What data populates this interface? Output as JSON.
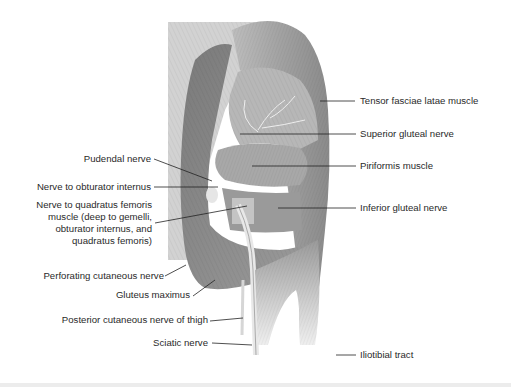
{
  "figure": {
    "labels_left": [
      {
        "id": "pudendal",
        "text": "Pudendal nerve"
      },
      {
        "id": "obturator",
        "text": "Nerve to obturator internus"
      },
      {
        "id": "quadratus_1",
        "text": "Nerve to quadratus femoris"
      },
      {
        "id": "quadratus_2",
        "text": "muscle (deep to gemelli,"
      },
      {
        "id": "quadratus_3",
        "text": "obturator internus, and"
      },
      {
        "id": "quadratus_4",
        "text": "quadratus femoris)"
      },
      {
        "id": "perforating",
        "text": "Perforating cutaneous nerve"
      },
      {
        "id": "gluteus_max",
        "text": "Gluteus maximus"
      },
      {
        "id": "post_cutaneous",
        "text": "Posterior cutaneous nerve of thigh"
      },
      {
        "id": "sciatic",
        "text": "Sciatic nerve"
      }
    ],
    "labels_right": [
      {
        "id": "tensor",
        "text": "Tensor fasciae latae muscle"
      },
      {
        "id": "sup_gluteal",
        "text": "Superior gluteal nerve"
      },
      {
        "id": "piriformis",
        "text": "Piriformis muscle"
      },
      {
        "id": "inf_gluteal",
        "text": "Inferior gluteal nerve"
      },
      {
        "id": "iliotibial",
        "text": "Iliotibial tract"
      }
    ],
    "colors": {
      "label_text": "#2a2a2a",
      "leader_line": "#222222",
      "muscle_dark": "#6f6f6f",
      "muscle_mid": "#a3a3a3",
      "muscle_light": "#d6d6d6",
      "background": "#ffffff"
    }
  }
}
